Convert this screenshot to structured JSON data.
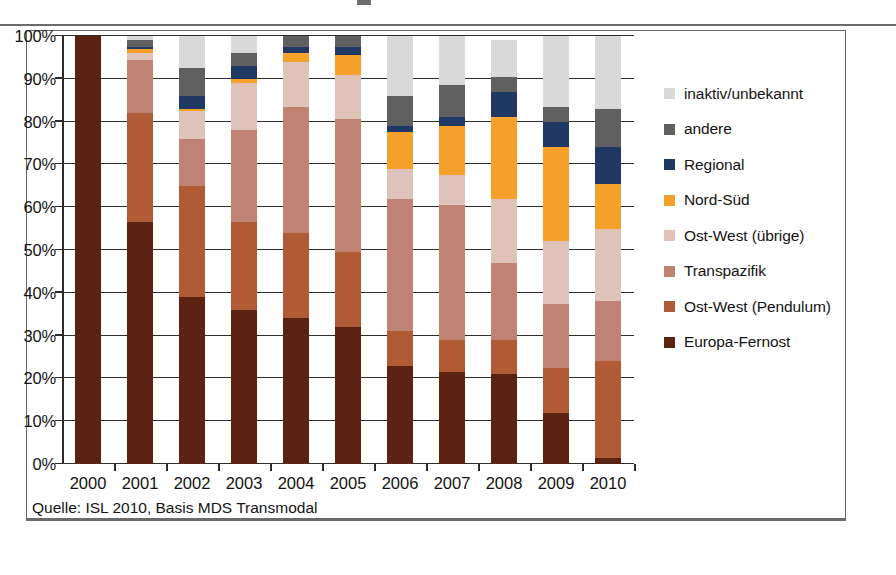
{
  "figure": {
    "source_note": "Quelle: ISL 2010, Basis MDS Transmodal",
    "caption": ""
  },
  "legend": {
    "items": [
      {
        "label": "inaktiv/unbekannt",
        "color": "#d9d9d9"
      },
      {
        "label": "andere",
        "color": "#5f5f5f"
      },
      {
        "label": "Regional",
        "color": "#1f3864"
      },
      {
        "label": "Nord-Süd",
        "color": "#f5a02b"
      },
      {
        "label": "Ost-West (übrige)",
        "color": "#e0c3b8"
      },
      {
        "label": "Transpazifik",
        "color": "#c08272"
      },
      {
        "label": "Ost-West (Pendulum)",
        "color": "#b05a36"
      },
      {
        "label": "Europa-Fernost",
        "color": "#5c2312"
      }
    ]
  },
  "chart_data": {
    "type": "bar",
    "stacked": true,
    "stack_mode": "percent",
    "title": "",
    "xlabel": "",
    "ylabel": "",
    "ylim": [
      0,
      100
    ],
    "ytick_labels": [
      "0%",
      "10%",
      "20%",
      "30%",
      "40%",
      "50%",
      "60%",
      "70%",
      "80%",
      "90%",
      "100%"
    ],
    "ytick_values": [
      0,
      10,
      20,
      30,
      40,
      50,
      60,
      70,
      80,
      90,
      100
    ],
    "grid": true,
    "legend_position": "right",
    "categories": [
      "2000",
      "2001",
      "2002",
      "2003",
      "2004",
      "2005",
      "2006",
      "2007",
      "2008",
      "2009",
      "2010"
    ],
    "series": [
      {
        "name": "Europa-Fernost",
        "color": "#5c2312",
        "values": [
          100.0,
          56.5,
          39.0,
          36.0,
          34.0,
          32.0,
          23.0,
          21.5,
          21.0,
          12.0,
          1.5
        ]
      },
      {
        "name": "Ost-West (Pendulum)",
        "color": "#b05a36",
        "values": [
          0.0,
          25.5,
          26.0,
          20.5,
          20.0,
          17.5,
          8.0,
          7.5,
          8.0,
          10.5,
          22.5
        ]
      },
      {
        "name": "Transpazifik",
        "color": "#c08272",
        "values": [
          0.0,
          12.5,
          11.0,
          21.5,
          29.5,
          31.0,
          31.0,
          31.5,
          18.0,
          15.0,
          14.0
        ]
      },
      {
        "name": "Ost-West (übrige)",
        "color": "#e0c3b8",
        "values": [
          0.0,
          1.5,
          6.5,
          11.0,
          10.5,
          10.5,
          7.0,
          7.0,
          15.0,
          14.5,
          17.0
        ]
      },
      {
        "name": "Nord-Süd",
        "color": "#f5a02b",
        "values": [
          0.0,
          1.0,
          0.5,
          1.0,
          2.0,
          4.5,
          8.5,
          11.5,
          19.0,
          22.0,
          10.5
        ]
      },
      {
        "name": "Regional",
        "color": "#1f3864",
        "values": [
          0.0,
          0.5,
          3.0,
          3.0,
          1.5,
          2.0,
          1.5,
          2.0,
          6.0,
          6.0,
          8.5
        ]
      },
      {
        "name": "andere",
        "color": "#5f5f5f",
        "values": [
          0.0,
          1.5,
          6.5,
          3.0,
          2.5,
          2.5,
          7.0,
          7.5,
          3.5,
          3.5,
          9.0
        ]
      },
      {
        "name": "inaktiv/unbekannt",
        "color": "#d9d9d9",
        "values": [
          0.0,
          1.0,
          7.5,
          4.0,
          0.0,
          0.0,
          14.0,
          11.5,
          8.5,
          16.5,
          17.0
        ]
      }
    ]
  }
}
